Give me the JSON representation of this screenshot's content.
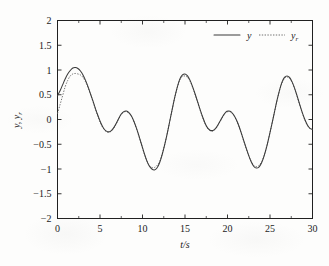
{
  "chart_data": {
    "type": "line",
    "title": "",
    "xlabel": "t/s",
    "ylabel": "y, y_r",
    "ylabel_main": "y",
    "ylabel_sub": "r",
    "xlim": [
      0,
      30
    ],
    "ylim": [
      -2,
      2
    ],
    "grid": false,
    "legend_position": "top-right-inside",
    "x_ticks": [
      0,
      5,
      10,
      15,
      20,
      25,
      30
    ],
    "x_tick_labels": [
      "0",
      "5",
      "10",
      "15",
      "20",
      "25",
      "30"
    ],
    "x_minor_ticks": [
      2.5,
      7.5,
      12.5,
      17.5,
      22.5,
      27.5
    ],
    "y_ticks": [
      -2,
      -1.5,
      -1,
      -0.5,
      0,
      0.5,
      1,
      1.5,
      2
    ],
    "y_tick_labels": [
      "−2",
      "−1.5",
      "−1",
      "−0.5",
      "0",
      "0.5",
      "1",
      "1.5",
      "2"
    ],
    "legend": [
      {
        "name": "y",
        "sub": "",
        "style": "solid",
        "color": "#3a3a3a"
      },
      {
        "name": "y",
        "sub": "r",
        "style": "dotted",
        "color": "#6a6a6a"
      }
    ],
    "series": [
      {
        "name": "y",
        "style": "solid",
        "color": "#3a3a3a",
        "x": [
          0.0,
          0.3,
          0.6,
          0.9,
          1.2,
          1.5,
          1.8,
          2.1,
          2.4,
          2.7,
          3.0,
          3.3,
          3.6,
          3.9,
          4.2,
          4.5,
          4.8,
          5.1,
          5.4,
          5.7,
          6.0,
          6.3,
          6.6,
          6.9,
          7.2,
          7.5,
          7.8,
          8.1,
          8.4,
          8.7,
          9.0,
          9.3,
          9.6,
          9.9,
          10.2,
          10.5,
          10.8,
          11.1,
          11.4,
          11.7,
          12.0,
          12.3,
          12.6,
          12.9,
          13.2,
          13.5,
          13.8,
          14.1,
          14.4,
          14.7,
          15.0,
          15.3,
          15.6,
          15.9,
          16.2,
          16.5,
          16.8,
          17.1,
          17.4,
          17.7,
          18.0,
          18.3,
          18.6,
          18.9,
          19.2,
          19.5,
          19.8,
          20.1,
          20.4,
          20.7,
          21.0,
          21.3,
          21.6,
          21.9,
          22.2,
          22.5,
          22.8,
          23.1,
          23.4,
          23.7,
          24.0,
          24.3,
          24.6,
          24.9,
          25.2,
          25.5,
          25.8,
          26.1,
          26.4,
          26.7,
          27.0,
          27.3,
          27.6,
          27.9,
          28.2,
          28.5,
          28.8,
          29.1,
          29.4,
          29.7,
          30.0
        ],
        "y": [
          0.48,
          0.58,
          0.7,
          0.82,
          0.92,
          0.99,
          1.04,
          1.05,
          1.03,
          0.98,
          0.9,
          0.79,
          0.66,
          0.51,
          0.36,
          0.2,
          0.06,
          -0.07,
          -0.17,
          -0.23,
          -0.25,
          -0.23,
          -0.17,
          -0.08,
          0.02,
          0.11,
          0.16,
          0.17,
          0.14,
          0.07,
          -0.04,
          -0.18,
          -0.34,
          -0.51,
          -0.68,
          -0.83,
          -0.94,
          -1.0,
          -1.02,
          -0.98,
          -0.88,
          -0.72,
          -0.52,
          -0.29,
          -0.04,
          0.21,
          0.45,
          0.66,
          0.82,
          0.9,
          0.92,
          0.88,
          0.79,
          0.66,
          0.51,
          0.35,
          0.19,
          0.04,
          -0.09,
          -0.18,
          -0.22,
          -0.22,
          -0.18,
          -0.1,
          -0.01,
          0.08,
          0.15,
          0.17,
          0.16,
          0.1,
          0.01,
          -0.11,
          -0.26,
          -0.42,
          -0.58,
          -0.73,
          -0.86,
          -0.95,
          -0.98,
          -0.96,
          -0.88,
          -0.74,
          -0.56,
          -0.34,
          -0.11,
          0.13,
          0.37,
          0.58,
          0.75,
          0.85,
          0.88,
          0.85,
          0.76,
          0.63,
          0.47,
          0.3,
          0.14,
          0.0,
          -0.11,
          -0.18,
          -0.2
        ]
      },
      {
        "name": "y_r",
        "style": "dotted",
        "color": "#6a6a6a",
        "x": [
          0.0,
          0.3,
          0.6,
          0.9,
          1.2,
          1.5,
          1.8,
          2.1,
          2.4,
          2.7,
          3.0,
          3.3,
          3.6,
          3.9,
          4.2,
          4.5,
          4.8,
          5.1,
          5.4,
          5.7,
          6.0,
          6.3,
          6.6,
          6.9,
          7.2,
          7.5,
          7.8,
          8.1,
          8.4,
          8.7,
          9.0,
          9.3,
          9.6,
          9.9,
          10.2,
          10.5,
          10.8,
          11.1,
          11.4,
          11.7,
          12.0,
          12.3,
          12.6,
          12.9,
          13.2,
          13.5,
          13.8,
          14.1,
          14.4,
          14.7,
          15.0,
          15.3,
          15.6,
          15.9,
          16.2,
          16.5,
          16.8,
          17.1,
          17.4,
          17.7,
          18.0,
          18.3,
          18.6,
          18.9,
          19.2,
          19.5,
          19.8,
          20.1,
          20.4,
          20.7,
          21.0,
          21.3,
          21.6,
          21.9,
          22.2,
          22.5,
          22.8,
          23.1,
          23.4,
          23.7,
          24.0,
          24.3,
          24.6,
          24.9,
          25.2,
          25.5,
          25.8,
          26.1,
          26.4,
          26.7,
          27.0,
          27.3,
          27.6,
          27.9,
          28.2,
          28.5,
          28.8,
          29.1,
          29.4,
          29.7,
          30.0
        ],
        "y": [
          0.12,
          0.3,
          0.48,
          0.66,
          0.79,
          0.88,
          0.92,
          0.93,
          0.92,
          0.9,
          0.85,
          0.76,
          0.64,
          0.5,
          0.35,
          0.19,
          0.04,
          -0.09,
          -0.18,
          -0.24,
          -0.26,
          -0.24,
          -0.18,
          -0.09,
          0.01,
          0.1,
          0.15,
          0.16,
          0.13,
          0.06,
          -0.05,
          -0.19,
          -0.35,
          -0.52,
          -0.69,
          -0.83,
          -0.93,
          -0.97,
          -0.97,
          -0.93,
          -0.85,
          -0.7,
          -0.51,
          -0.29,
          -0.04,
          0.21,
          0.45,
          0.65,
          0.8,
          0.87,
          0.88,
          0.85,
          0.77,
          0.65,
          0.5,
          0.34,
          0.18,
          0.03,
          -0.1,
          -0.19,
          -0.23,
          -0.23,
          -0.19,
          -0.11,
          -0.02,
          0.07,
          0.14,
          0.16,
          0.15,
          0.09,
          0.0,
          -0.12,
          -0.27,
          -0.43,
          -0.59,
          -0.73,
          -0.85,
          -0.93,
          -0.95,
          -0.93,
          -0.86,
          -0.73,
          -0.55,
          -0.34,
          -0.11,
          0.13,
          0.36,
          0.57,
          0.73,
          0.83,
          0.86,
          0.83,
          0.75,
          0.62,
          0.46,
          0.29,
          0.13,
          -0.01,
          -0.12,
          -0.18,
          -0.2
        ]
      }
    ]
  }
}
